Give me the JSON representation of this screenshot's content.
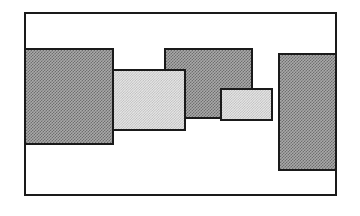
{
  "figure": {
    "canvas": {
      "width": 360,
      "height": 216,
      "background": "#ffffff"
    },
    "frame": {
      "label": "outer-frame",
      "x": 24,
      "y": 12,
      "width": 313,
      "height": 184,
      "border_color": "#1a1a1a",
      "border_width": 2,
      "fill": "none"
    },
    "palette": {
      "dark_fill": "#999999",
      "light_fill": "#d8d8d8",
      "outline": "#1a1a1a",
      "background": "#ffffff"
    },
    "legend": {
      "dark_label": "dark hatched block",
      "light_label": "light hatched block"
    },
    "blocks": [
      {
        "id": "block-1",
        "label": "Block 1",
        "shade": "dark",
        "x": 24,
        "y": 48,
        "width": 90,
        "height": 97,
        "z": 4,
        "fill": "#999999",
        "outline": "#1a1a1a"
      },
      {
        "id": "block-2",
        "label": "Block 2",
        "shade": "light",
        "x": 112,
        "y": 69,
        "width": 74,
        "height": 62,
        "z": 3,
        "fill": "#d8d8d8",
        "outline": "#1a1a1a"
      },
      {
        "id": "block-3",
        "label": "Block 3",
        "shade": "dark",
        "x": 164,
        "y": 48,
        "width": 89,
        "height": 71,
        "z": 1,
        "fill": "#999999",
        "outline": "#1a1a1a"
      },
      {
        "id": "block-4",
        "label": "Block 4",
        "shade": "light",
        "x": 220,
        "y": 88,
        "width": 53,
        "height": 33,
        "z": 5,
        "fill": "#d8d8d8",
        "outline": "#1a1a1a"
      },
      {
        "id": "block-5",
        "label": "Block 5",
        "shade": "dark",
        "x": 278,
        "y": 53,
        "width": 59,
        "height": 118,
        "z": 2,
        "fill": "#999999",
        "outline": "#1a1a1a"
      }
    ]
  }
}
